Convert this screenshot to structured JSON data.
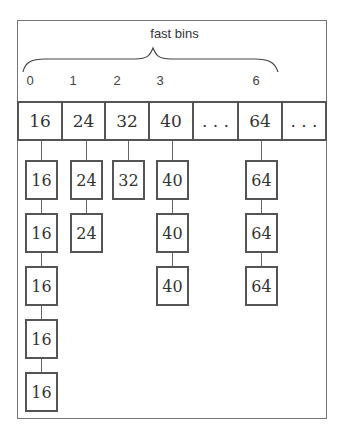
{
  "diagram": {
    "title": "fast bins",
    "indices": [
      {
        "label": "0",
        "x": 30
      },
      {
        "label": "1",
        "x": 73
      },
      {
        "label": "2",
        "x": 117
      },
      {
        "label": "3",
        "x": 160
      },
      {
        "label": "6",
        "x": 256
      }
    ],
    "top_row": [
      {
        "label": "16",
        "left": 17,
        "width": 46
      },
      {
        "label": "24",
        "left": 61,
        "width": 45
      },
      {
        "label": "32",
        "left": 104,
        "width": 46
      },
      {
        "label": "40",
        "left": 148,
        "width": 46
      },
      {
        "label": "...",
        "left": 192,
        "width": 47
      },
      {
        "label": "64",
        "left": 237,
        "width": 46
      },
      {
        "label": "...",
        "left": 281,
        "width": 46
      }
    ],
    "chains": [
      {
        "bin": "0",
        "cx": 41,
        "nodes": [
          "16",
          "16",
          "16",
          "16",
          "16"
        ]
      },
      {
        "bin": "1",
        "cx": 86,
        "nodes": [
          "24",
          "24"
        ]
      },
      {
        "bin": "2",
        "cx": 128,
        "nodes": [
          "32"
        ]
      },
      {
        "bin": "3",
        "cx": 172,
        "nodes": [
          "40",
          "40",
          "40"
        ]
      },
      {
        "bin": "6",
        "cx": 261,
        "nodes": [
          "64",
          "64",
          "64"
        ]
      }
    ]
  }
}
